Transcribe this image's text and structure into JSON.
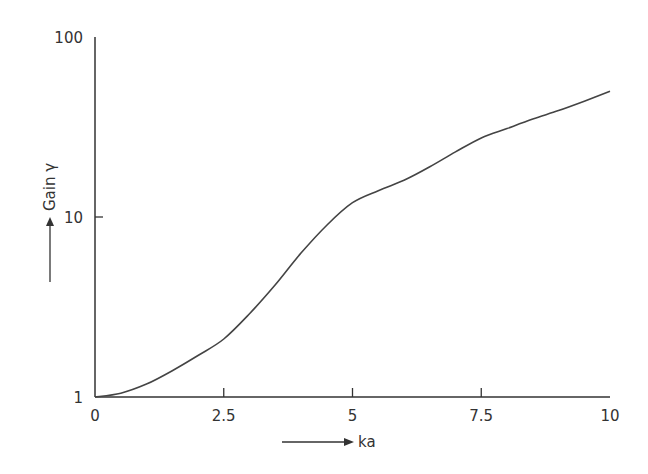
{
  "chart_data": {
    "type": "line",
    "title": "",
    "xlabel": "ka",
    "ylabel": "Gain γ",
    "x_scale": "linear",
    "y_scale": "log",
    "xlim": [
      0,
      10
    ],
    "ylim": [
      1,
      100
    ],
    "x_ticks": [
      0,
      2.5,
      5,
      7.5,
      10
    ],
    "x_tick_labels": [
      "0",
      "2.5",
      "5",
      "7.5",
      "10"
    ],
    "y_ticks": [
      1,
      10,
      100
    ],
    "y_tick_labels": [
      "1",
      "10",
      "100"
    ],
    "grid": false,
    "legend": null,
    "series": [
      {
        "name": "Gain",
        "x": [
          0,
          0.5,
          1,
          1.5,
          2,
          2.5,
          3,
          3.5,
          4,
          4.5,
          5,
          5.5,
          6,
          6.5,
          7,
          7.5,
          8,
          8.5,
          9,
          9.5,
          10
        ],
        "values": [
          1.0,
          1.05,
          1.18,
          1.4,
          1.7,
          2.1,
          2.9,
          4.2,
          6.3,
          9.0,
          12.0,
          14.0,
          16.0,
          19.0,
          23.0,
          27.5,
          31.0,
          35.0,
          39.0,
          44.0,
          50.0
        ]
      }
    ]
  }
}
